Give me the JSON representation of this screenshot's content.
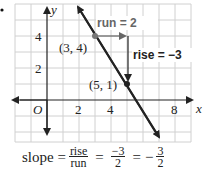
{
  "bullet": "•",
  "graph": {
    "axes": {
      "x_label": "x",
      "y_label": "y",
      "origin_label": "O",
      "x_ticks": [
        "2",
        "4",
        "8"
      ],
      "y_ticks": [
        "4",
        "2"
      ]
    },
    "points": [
      {
        "label": "(3, 4)",
        "x": 3,
        "y": 4
      },
      {
        "label": "(5, 1)",
        "x": 5,
        "y": 1
      }
    ],
    "annotations": {
      "run": "run = 2",
      "rise": "rise = −3"
    },
    "colors": {
      "grid": "#d0d0d0",
      "line": "#222222",
      "arrow": "#666666",
      "point": "#777777"
    }
  },
  "formula": {
    "lhs": "slope =",
    "frac1_num": "rise",
    "frac1_den": "run",
    "eq1": "=",
    "frac2_num": "−3",
    "frac2_den": "2",
    "eq2": "=",
    "neg": "−",
    "frac3_num": "3",
    "frac3_den": "2"
  }
}
